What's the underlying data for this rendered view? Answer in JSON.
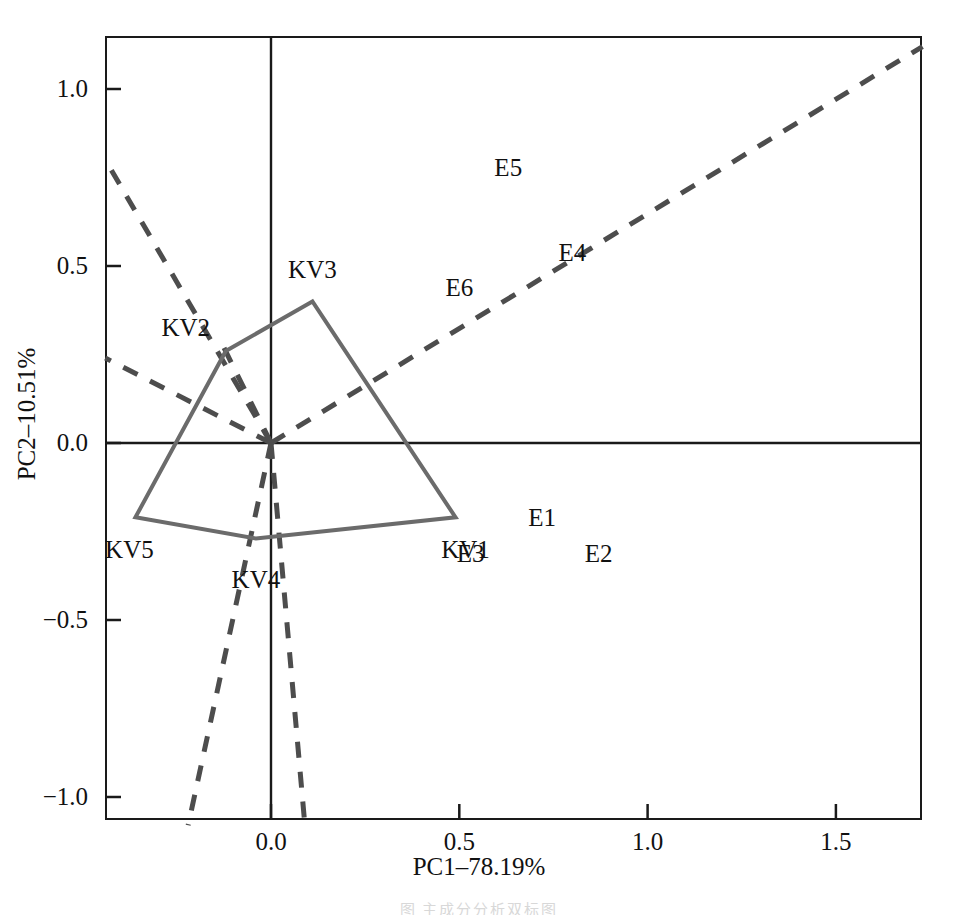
{
  "chart_data": {
    "type": "scatter",
    "title": "",
    "xlabel": "PC1–78.19%",
    "ylabel": "PC2–10.51%",
    "xlim": [
      -0.44,
      1.73
    ],
    "ylim": [
      -1.08,
      1.14
    ],
    "grid": false,
    "legend": "none",
    "xticks": [
      {
        "value": 0.0,
        "label": "0.0"
      },
      {
        "value": 0.5,
        "label": "0.5"
      },
      {
        "value": 1.0,
        "label": "1.0"
      },
      {
        "value": 1.5,
        "label": "1.5"
      }
    ],
    "yticks": [
      {
        "value": 1.0,
        "label": "1.0"
      },
      {
        "value": 0.5,
        "label": "0.5"
      },
      {
        "value": 0.0,
        "label": "0.0"
      },
      {
        "value": -0.5,
        "label": "−0.5"
      },
      {
        "value": -1.0,
        "label": "−1.0"
      }
    ],
    "sample_points": [
      {
        "name": "E1",
        "x": 0.72,
        "y": -0.21
      },
      {
        "name": "E2",
        "x": 0.87,
        "y": -0.31
      },
      {
        "name": "E3",
        "x": 0.53,
        "y": -0.31
      },
      {
        "name": "E4",
        "x": 0.8,
        "y": 0.54
      },
      {
        "name": "E5",
        "x": 0.63,
        "y": 0.78
      },
      {
        "name": "E6",
        "x": 0.5,
        "y": 0.44
      }
    ],
    "polygon_vertices": [
      {
        "name": "KV3",
        "x": 0.11,
        "y": 0.4
      },
      {
        "name": "KV2",
        "x": -0.12,
        "y": 0.26
      },
      {
        "name": "KV5",
        "x": -0.36,
        "y": -0.21
      },
      {
        "name": "KV4",
        "x": -0.04,
        "y": -0.27
      },
      {
        "name": "KV1",
        "x": 0.49,
        "y": -0.21
      }
    ],
    "polygon_label_offsets": [
      {
        "name": "KV3",
        "dx": 0,
        "dy": -32
      },
      {
        "name": "KV2",
        "dx": -40,
        "dy": -24
      },
      {
        "name": "KV5",
        "dx": -6,
        "dy": 32
      },
      {
        "name": "KV4",
        "dx": 0,
        "dy": 40
      },
      {
        "name": "KV1",
        "dx": 10,
        "dy": 32
      }
    ],
    "loading_vectors": [
      {
        "name": "loading-1",
        "x1": 0.0,
        "y1": 0.0,
        "x2": -0.44,
        "y2": 0.8
      },
      {
        "name": "loading-2",
        "x1": 0.0,
        "y1": 0.0,
        "x2": -0.44,
        "y2": 0.24
      },
      {
        "name": "loading-3",
        "x1": 0.0,
        "y1": 0.0,
        "x2": 1.73,
        "y2": 1.12
      },
      {
        "name": "loading-4",
        "x1": 0.0,
        "y1": 0.0,
        "x2": -0.13,
        "y2": 0.28
      },
      {
        "name": "loading-5",
        "x1": 0.0,
        "y1": 0.0,
        "x2": -0.22,
        "y2": -1.08
      },
      {
        "name": "loading-6",
        "x1": 0.0,
        "y1": 0.0,
        "x2": 0.09,
        "y2": -1.08
      }
    ],
    "styles": {
      "polygon_color": "#6b6b6b",
      "loading_color": "#4d4d4d",
      "axis_color": "#1a1a1a",
      "frame_color": "#1a1a1a",
      "text_color": "#111111"
    }
  },
  "caption": {
    "bottom_text": "图  主成分分析双标图"
  }
}
